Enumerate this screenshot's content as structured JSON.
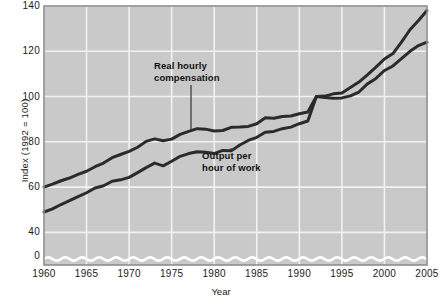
{
  "chart_data": {
    "type": "line",
    "title": "",
    "xlabel": "Year",
    "ylabel": "Index (1992 = 100)",
    "xlim": [
      1960,
      2005
    ],
    "ylim": [
      0,
      140
    ],
    "y_axis_break": true,
    "y_break_note": "wavy break line drawn just above the 0 baseline",
    "grid": true,
    "legend_position": "inline-annotations",
    "x_ticks": [
      "1960",
      "1965",
      "1970",
      "1975",
      "1980",
      "1985",
      "1990",
      "1995",
      "2000",
      "2005"
    ],
    "y_ticks": [
      "0",
      "40",
      "60",
      "80",
      "100",
      "120",
      "140"
    ],
    "x": [
      1960,
      1961,
      1962,
      1963,
      1964,
      1965,
      1966,
      1967,
      1968,
      1969,
      1970,
      1971,
      1972,
      1973,
      1974,
      1975,
      1976,
      1977,
      1978,
      1979,
      1980,
      1981,
      1982,
      1983,
      1984,
      1985,
      1986,
      1987,
      1988,
      1989,
      1990,
      1991,
      1992,
      1993,
      1994,
      1995,
      1996,
      1997,
      1998,
      1999,
      2000,
      2001,
      2002,
      2003,
      2004,
      2005
    ],
    "series": [
      {
        "name": "Real hourly compensation",
        "color": "#2b2b2b",
        "values": [
          60.0,
          61.3,
          62.8,
          64.0,
          65.6,
          67.0,
          69.0,
          70.6,
          73.0,
          74.4,
          75.8,
          77.6,
          80.2,
          81.3,
          80.5,
          81.2,
          83.3,
          84.6,
          85.8,
          85.6,
          84.8,
          85.0,
          86.4,
          86.5,
          86.8,
          88.0,
          90.6,
          90.4,
          91.2,
          91.4,
          92.4,
          93.2,
          100.0,
          99.6,
          99.3,
          99.4,
          100.3,
          102.0,
          105.6,
          108.0,
          111.5,
          113.5,
          116.8,
          120.0,
          122.5,
          124.0
        ]
      },
      {
        "name": "Output per hour of work",
        "color": "#2b2b2b",
        "values": [
          49.0,
          50.4,
          52.3,
          54.0,
          55.8,
          57.5,
          59.6,
          60.6,
          62.6,
          63.2,
          64.3,
          66.4,
          68.6,
          70.6,
          69.4,
          71.4,
          73.6,
          74.8,
          75.6,
          75.4,
          74.8,
          76.2,
          76.0,
          78.6,
          80.6,
          82.0,
          84.2,
          84.6,
          85.8,
          86.5,
          88.0,
          89.2,
          100.0,
          100.2,
          101.2,
          101.6,
          104.0,
          106.4,
          109.6,
          113.0,
          116.6,
          119.0,
          124.0,
          129.5,
          133.6,
          138.0
        ]
      }
    ],
    "annotations": [
      {
        "name": "real-hourly-compensation",
        "line1": "Real hourly",
        "line2": "compensation"
      },
      {
        "name": "output-per-hour-of-work",
        "line1": "Output per",
        "line2": "hour of work"
      }
    ]
  },
  "style": {
    "plot_background": "#c9c9c9",
    "gridline_color": "#f2f2f2",
    "line_color": "#2b2b2b",
    "frame_color": "#8e8e8e",
    "text_color": "#1a1a1a"
  }
}
